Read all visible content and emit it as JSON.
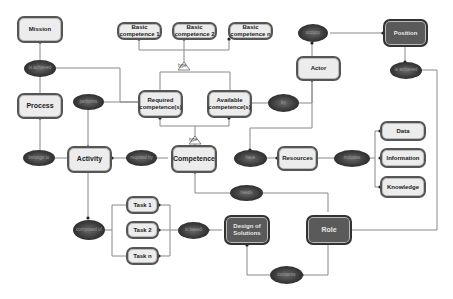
{
  "entities": {
    "mission": "Mission",
    "process": "Process",
    "activity": "Activity",
    "basic1": "Basic competence 1",
    "basic2": "Basic competence 2",
    "basicn": "Basic competence n",
    "required": "Required competence(s)",
    "available": "Available competence(s)",
    "competence": "Competence",
    "actor": "Actor",
    "position": "Position",
    "resources": "Resources",
    "data": "Data",
    "information": "Information",
    "knowledge": "Knowledge",
    "task1": "Task 1",
    "task2": "Task 2",
    "taskn": "Task n",
    "design": "Design of Solutions",
    "role": "Role"
  },
  "relations": {
    "is_achieved_mission": "is achieved",
    "performs": "performs",
    "belongs_to": "belongs to",
    "required_by": "required by",
    "by": "by",
    "occupy": "occupy",
    "is_achieved_position": "is achieved",
    "have": "have",
    "includes_resources": "includes",
    "needs": "needs",
    "composed_of": "composed of",
    "is_based": "is based",
    "concerns": "concerns"
  },
  "type_labels": {
    "top": "type",
    "bottom": "type"
  }
}
